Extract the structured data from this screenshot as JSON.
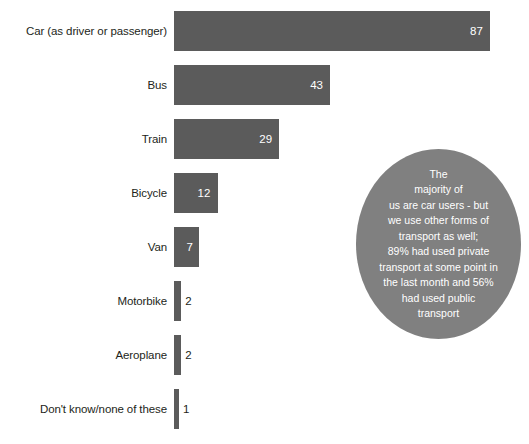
{
  "chart_data": {
    "type": "bar",
    "orientation": "horizontal",
    "title": "",
    "subtitle": "",
    "xlabel": "",
    "ylabel": "",
    "grid": false,
    "legend": "none",
    "xlim": [
      0,
      87
    ],
    "value_suffix": "",
    "bar_color": "#5b5b5b",
    "inline_label_color": "#ffffff",
    "outside_label_color": "#231f20",
    "categories": [
      "Car (as driver or passenger)",
      "Bus",
      "Train",
      "Bicycle",
      "Van",
      "Motorbike",
      "Aeroplane",
      "Don't know/none of these"
    ],
    "values": [
      87,
      43,
      29,
      12,
      7,
      2,
      2,
      1
    ],
    "labels": [
      "87",
      "43",
      "29",
      "12",
      "7",
      "2",
      "2",
      "1"
    ],
    "label_inside": [
      true,
      true,
      true,
      true,
      true,
      false,
      false,
      false
    ]
  },
  "bars": [
    {
      "label": "Car (as driver or passenger)",
      "value": 87,
      "value_text": "87",
      "inside": true
    },
    {
      "label": "Bus",
      "value": 43,
      "value_text": "43",
      "inside": true
    },
    {
      "label": "Train",
      "value": 29,
      "value_text": "29",
      "inside": true
    },
    {
      "label": "Bicycle",
      "value": 12,
      "value_text": "12",
      "inside": true
    },
    {
      "label": "Van",
      "value": 7,
      "value_text": "7",
      "inside": true
    },
    {
      "label": "Motorbike",
      "value": 2,
      "value_text": "2",
      "inside": false
    },
    {
      "label": "Aeroplane",
      "value": 2,
      "value_text": "2",
      "inside": false
    },
    {
      "label": "Don't know/none of these",
      "value": 1,
      "value_text": "1",
      "inside": false
    }
  ],
  "callout": {
    "background_color": "#808080",
    "text_color": "#ffffff",
    "lines": [
      "The",
      "majority of",
      "us are car users - but",
      "we use other forms of",
      "transport as well;",
      "89% had used private",
      "transport at some point in",
      "the last month and 56%",
      "had used public",
      "transport"
    ],
    "full_text": "The majority of us are car users - but we use other forms of transport as well; 89% had used private transport at some point in the last month and 56% had used public transport"
  }
}
